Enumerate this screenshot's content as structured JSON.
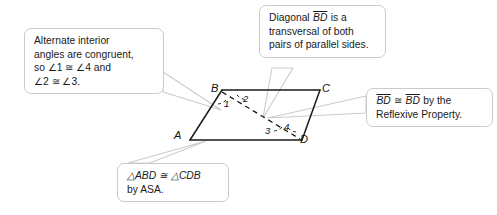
{
  "figure": {
    "name": "parallelogram-abcd-with-diagonal",
    "vertices": [
      {
        "label": "A",
        "x": 190,
        "y": 140
      },
      {
        "label": "B",
        "x": 222,
        "y": 90
      },
      {
        "label": "C",
        "x": 320,
        "y": 90
      },
      {
        "label": "D",
        "x": 302,
        "y": 140
      }
    ],
    "angles": [
      {
        "label": "1",
        "at": "B"
      },
      {
        "label": "2",
        "at": "B"
      },
      {
        "label": "3",
        "at": "D"
      },
      {
        "label": "4",
        "at": "D"
      }
    ],
    "diagonal": {
      "from": "B",
      "to": "D",
      "style": "dashed"
    },
    "stroke_color": "#1a1a1a"
  },
  "callouts": {
    "alt_interior": {
      "lines": [
        "Alternate interior",
        "angles are congruent,",
        "so ∠1 ≅ ∠4 and",
        "∠2 ≅ ∠3."
      ]
    },
    "diagonal": {
      "line1_pre": "Diagonal ",
      "line1_seg": "BD",
      "line1_post": " is a",
      "line2": "transversal of both",
      "line3": "pairs of parallel sides."
    },
    "reflexive": {
      "seg1": "BD",
      "cong": " ≅ ",
      "seg2": "BD",
      "line1_post": " by the",
      "line2": "Reflexive Property."
    },
    "asa": {
      "line1": "△ABD ≅ △CDB",
      "line2": "by ASA."
    }
  },
  "colors": {
    "callout_border": "#c9ccce",
    "callout_fill": "#ffffff",
    "figure_stroke": "#1a1a1a",
    "tail_stroke": "#c9ccce",
    "background": "#ffffff"
  }
}
